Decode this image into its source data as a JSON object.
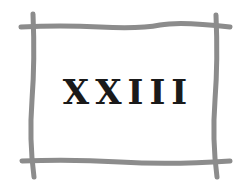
{
  "title": "XXIII",
  "colors": {
    "frame": "#8c8c8c",
    "text": "#1a1a1a",
    "background": "#ffffff"
  }
}
